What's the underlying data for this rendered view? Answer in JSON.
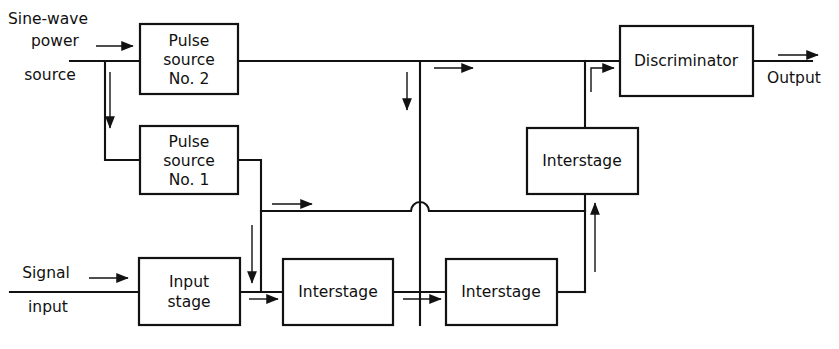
{
  "figure": {
    "type": "block-diagram",
    "title": "",
    "background_color": "#ffffff",
    "line_color": "#121212",
    "text_color": "#101010"
  },
  "blocks": [
    {
      "id": "pulse-source-2",
      "lines": [
        "Pulse",
        "source",
        "No. 2"
      ],
      "x": 140,
      "y": 24,
      "w": 98,
      "h": 70
    },
    {
      "id": "pulse-source-1",
      "lines": [
        "Pulse",
        "source",
        "No. 1"
      ],
      "x": 140,
      "y": 126,
      "w": 98,
      "h": 68
    },
    {
      "id": "input-stage",
      "lines": [
        "Input",
        "stage"
      ],
      "x": 139,
      "y": 258,
      "w": 101,
      "h": 67
    },
    {
      "id": "interstage-bottom-1",
      "lines": [
        "Interstage"
      ],
      "x": 283,
      "y": 259,
      "w": 110,
      "h": 66
    },
    {
      "id": "interstage-bottom-2",
      "lines": [
        "Interstage"
      ],
      "x": 446,
      "y": 259,
      "w": 111,
      "h": 66
    },
    {
      "id": "interstage-upper-right",
      "lines": [
        "Interstage"
      ],
      "x": 527,
      "y": 128,
      "w": 111,
      "h": 66
    },
    {
      "id": "discriminator",
      "lines": [
        "Discriminator"
      ],
      "x": 620,
      "y": 26,
      "w": 133,
      "h": 70
    }
  ],
  "io_labels": {
    "sine_wave_line1": "Sine-wave",
    "sine_wave_line2": "power",
    "sine_wave_line3": "source",
    "signal_line1": "Signal",
    "signal_line2": "input",
    "output": "Output"
  }
}
